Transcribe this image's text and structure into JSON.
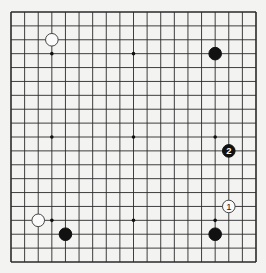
{
  "board": {
    "size": 19,
    "origin_x": 11,
    "origin_y": 12,
    "width": 245,
    "height": 250,
    "line_color": "#2a2a2a",
    "background": "#f3f3f1",
    "hoshi": [
      [
        3,
        3
      ],
      [
        9,
        3
      ],
      [
        15,
        3
      ],
      [
        3,
        9
      ],
      [
        9,
        9
      ],
      [
        15,
        9
      ],
      [
        3,
        15
      ],
      [
        9,
        15
      ],
      [
        15,
        15
      ]
    ]
  },
  "stones": [
    {
      "color": "white",
      "col": 3,
      "row": 2,
      "label": ""
    },
    {
      "color": "black",
      "col": 15,
      "row": 3,
      "label": ""
    },
    {
      "color": "black",
      "col": 16,
      "row": 10,
      "label": "2"
    },
    {
      "color": "white",
      "col": 16,
      "row": 14,
      "label": "1"
    },
    {
      "color": "black",
      "col": 15,
      "row": 16,
      "label": ""
    },
    {
      "color": "white",
      "col": 2,
      "row": 15,
      "label": ""
    },
    {
      "color": "black",
      "col": 4,
      "row": 16,
      "label": ""
    }
  ]
}
